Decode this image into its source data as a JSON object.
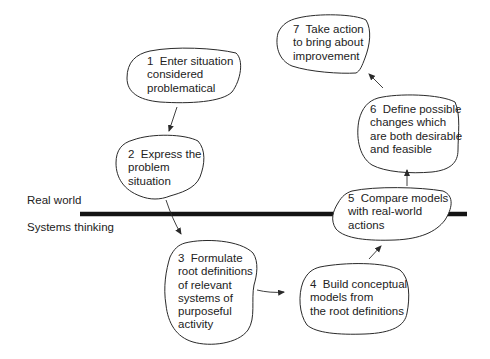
{
  "diagram": {
    "type": "soft-systems-methodology-cycle",
    "zones": {
      "upper": "Real world",
      "lower": "Systems thinking"
    },
    "stages": [
      {
        "id": 1,
        "number": "1",
        "lines": [
          "1  Enter situation",
          "considered",
          "problematical"
        ],
        "zone": "Real world"
      },
      {
        "id": 2,
        "number": "2",
        "lines": [
          "2  Express the",
          "problem",
          "situation"
        ],
        "zone": "Real world"
      },
      {
        "id": 3,
        "number": "3",
        "lines": [
          "3  Formulate",
          "root definitions",
          "of relevant",
          "systems of",
          "purposeful",
          "activity"
        ],
        "zone": "Systems thinking"
      },
      {
        "id": 4,
        "number": "4",
        "lines": [
          "4  Build conceptual",
          "models from",
          "the root definitions"
        ],
        "zone": "Systems thinking"
      },
      {
        "id": 5,
        "number": "5",
        "lines": [
          "5  Compare models",
          "with real-world",
          "actions"
        ],
        "zone": "Boundary"
      },
      {
        "id": 6,
        "number": "6",
        "lines": [
          "6  Define possible",
          "changes which",
          "are both desirable",
          "and feasible"
        ],
        "zone": "Real world"
      },
      {
        "id": 7,
        "number": "7",
        "lines": [
          "7  Take action",
          "to bring about",
          "improvement"
        ],
        "zone": "Real world"
      }
    ],
    "edges": [
      {
        "from": 1,
        "to": 2
      },
      {
        "from": 2,
        "to": 3
      },
      {
        "from": 3,
        "to": 4
      },
      {
        "from": 4,
        "to": 5
      },
      {
        "from": 5,
        "to": 6
      },
      {
        "from": 6,
        "to": 7
      }
    ],
    "text": {
      "s1": "1  Enter situation\nconsidered\nproblematical",
      "s2": "2  Express the\nproblem\nsituation",
      "s3": "3  Formulate\nroot definitions\nof relevant\nsystems of\npurposeful\nactivity",
      "s4": "4  Build conceptual\nmodels from\nthe root definitions",
      "s5": "5  Compare models\nwith real-world\nactions",
      "s6": "6  Define possible\nchanges which\nare both desirable\nand feasible",
      "s7": "7  Take action\nto bring about\nimprovement"
    }
  }
}
